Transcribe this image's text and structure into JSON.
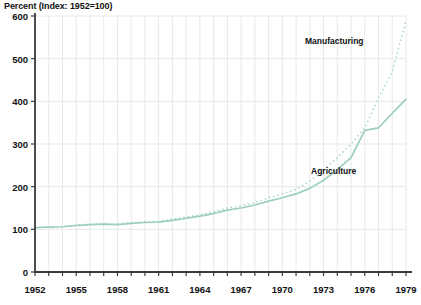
{
  "chart_data": {
    "type": "line",
    "title": "Percent (Index: 1952=100)",
    "xlabel": "",
    "ylabel": "Percent (Index: 1952=100)",
    "xlim": [
      1952,
      1979
    ],
    "ylim": [
      0,
      600
    ],
    "yticks": [
      0,
      100,
      200,
      300,
      400,
      500,
      600
    ],
    "xticks": [
      1952,
      1955,
      1958,
      1961,
      1964,
      1967,
      1970,
      1973,
      1976,
      1979
    ],
    "xtick_labels": [
      "1952",
      "1955",
      "1958",
      "1961",
      "1964",
      "1967",
      "1970",
      "1973",
      "1976",
      "1979"
    ],
    "ytick_labels": [
      "0",
      "100",
      "200",
      "300",
      "400",
      "500",
      "600"
    ],
    "grid": true,
    "grid_color": "#e8e8e8",
    "legend_position": "inline-annotations",
    "x": [
      1952,
      1953,
      1954,
      1955,
      1956,
      1957,
      1958,
      1959,
      1960,
      1961,
      1962,
      1963,
      1964,
      1965,
      1966,
      1967,
      1968,
      1969,
      1970,
      1971,
      1972,
      1973,
      1974,
      1975,
      1976,
      1977,
      1978,
      1979
    ],
    "series": [
      {
        "name": "Manufacturing",
        "style": "dotted",
        "color": "#a9d6c4",
        "values": [
          104,
          105,
          106,
          110,
          112,
          113,
          112,
          116,
          118,
          119,
          124,
          129,
          134,
          141,
          150,
          155,
          163,
          174,
          183,
          194,
          212,
          240,
          268,
          300,
          338,
          408,
          470,
          590
        ]
      },
      {
        "name": "Agriculture",
        "style": "solid",
        "color": "#9ccfbd",
        "values": [
          104,
          105,
          106,
          109,
          111,
          112,
          111,
          114,
          116,
          117,
          121,
          126,
          131,
          137,
          145,
          150,
          157,
          166,
          174,
          183,
          196,
          215,
          240,
          268,
          332,
          338,
          372,
          405
        ]
      }
    ],
    "annotations": [
      {
        "text": "Manufacturing",
        "series": "Manufacturing"
      },
      {
        "text": "Agriculture",
        "series": "Agriculture"
      }
    ]
  }
}
